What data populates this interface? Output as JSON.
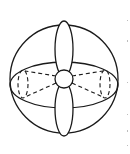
{
  "diagram": {
    "stroke_color": "#1a1a1a",
    "background": "#ffffff",
    "outer_circle": {
      "cx": 64,
      "cy": 79,
      "r": 54
    },
    "equator_ellipse": {
      "cx": 64,
      "cy": 85,
      "rx": 54,
      "ry": 23
    },
    "top_lobe": {
      "cx": 64,
      "cy": 49,
      "rx": 9,
      "ry": 28
    },
    "bottom_lobe": {
      "cx": 64,
      "cy": 109,
      "rx": 9,
      "ry": 27
    },
    "center_circle": {
      "cx": 64,
      "cy": 79,
      "r": 9
    },
    "left_dashed_ellipse": {
      "cx": 23,
      "cy": 84,
      "rx": 5,
      "ry": 14
    },
    "right_dashed_ellipse": {
      "cx": 105,
      "cy": 84,
      "rx": 5,
      "ry": 14
    }
  }
}
